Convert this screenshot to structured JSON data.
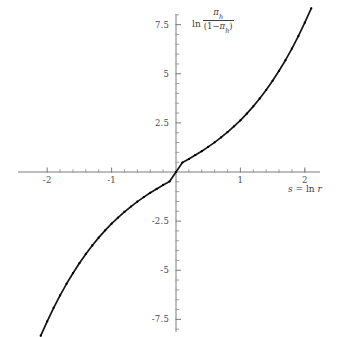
{
  "figure": {
    "background": "#ffffff",
    "width": 355,
    "height": 337,
    "curve_color": "#151515",
    "axis_color": "#6e6e6e",
    "label_color": "#3d3d3d"
  },
  "labels": {
    "y_axis_ln": "ln",
    "y_axis_numerator": "π",
    "y_axis_numerator_sub": "h",
    "y_axis_denominator_open": "(1−",
    "y_axis_denominator_pi": "π",
    "y_axis_denominator_sub": "h",
    "y_axis_denominator_close": ")",
    "x_axis_s": "s",
    "x_axis_equals": " = ",
    "x_axis_ln": "ln",
    "x_axis_r": "r"
  },
  "chart_data": {
    "type": "line",
    "title": "",
    "subtitle": "",
    "xlabel": "s = ln r",
    "ylabel": "ln π_h/(1-π_h)",
    "xlim": [
      -2.15,
      2.15
    ],
    "ylim": [
      -8.6,
      8.6
    ],
    "grid": false,
    "legend": null,
    "x_ticks_major": [
      -2,
      -1,
      1,
      2
    ],
    "x_tick_labels": [
      "-2",
      "-1",
      "1",
      "2"
    ],
    "x_ticks_minor": [
      -1.8,
      -1.6,
      -1.4,
      -1.2,
      -0.8,
      -0.6,
      -0.4,
      -0.2,
      0.2,
      0.4,
      0.6,
      0.8,
      1.2,
      1.4,
      1.6,
      1.8,
      2.0
    ],
    "y_ticks_major": [
      -7.5,
      -5,
      -2.5,
      2.5,
      5,
      7.5
    ],
    "y_tick_labels": [
      "-7.5",
      "-5",
      "-2.5",
      "2.5",
      "5",
      "7.5"
    ],
    "y_ticks_minor": [
      -8,
      -7,
      -6.5,
      -6,
      -5.5,
      -4.5,
      -4,
      -3.5,
      -3,
      -2,
      -1.5,
      -1,
      -0.5,
      0.5,
      1,
      1.5,
      2,
      3,
      3.5,
      4,
      4.5,
      5.5,
      6,
      6.5,
      7,
      8
    ],
    "marker_style": "small filled dots overlaid on curve",
    "series": [
      {
        "name": "logit of pi_h vs s",
        "x": [
          -2.1,
          -2.0,
          -1.9,
          -1.8,
          -1.7,
          -1.6,
          -1.5,
          -1.4,
          -1.3,
          -1.2,
          -1.1,
          -1.0,
          -0.9,
          -0.8,
          -0.7,
          -0.6,
          -0.5,
          -0.4,
          -0.3,
          -0.2,
          -0.1,
          0.0,
          0.1,
          0.2,
          0.3,
          0.4,
          0.5,
          0.6,
          0.7,
          0.8,
          0.9,
          1.0,
          1.1,
          1.2,
          1.3,
          1.4,
          1.5,
          1.6,
          1.7,
          1.8,
          1.9,
          2.0,
          2.1
        ],
        "y": [
          -8.33,
          -7.6,
          -6.91,
          -6.28,
          -5.69,
          -5.15,
          -4.64,
          -4.17,
          -3.74,
          -3.34,
          -2.97,
          -2.63,
          -2.32,
          -2.03,
          -1.76,
          -1.51,
          -1.28,
          -1.06,
          -0.86,
          -0.66,
          -0.48,
          0.0,
          0.48,
          0.66,
          0.86,
          1.06,
          1.28,
          1.51,
          1.76,
          2.03,
          2.32,
          2.63,
          2.97,
          3.34,
          3.74,
          4.17,
          4.64,
          5.15,
          5.69,
          6.28,
          6.91,
          7.6,
          8.33
        ]
      }
    ]
  }
}
